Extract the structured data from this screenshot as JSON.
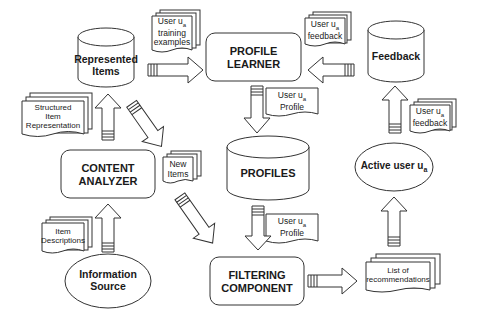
{
  "diagram": {
    "nodes": {
      "represented_items": {
        "label": "Represented Items",
        "shape": "cylinder"
      },
      "profile_learner": {
        "label_line1": "PROFILE",
        "label_line2": "LEARNER",
        "shape": "rounded-rect"
      },
      "feedback": {
        "label": "Feedback",
        "shape": "cylinder"
      },
      "content_analyzer": {
        "label_line1": "CONTENT",
        "label_line2": "ANALYZER",
        "shape": "rounded-rect"
      },
      "profiles": {
        "label": "PROFILES",
        "shape": "cylinder"
      },
      "active_user": {
        "label": "Active user u",
        "subscript": "a",
        "shape": "ellipse"
      },
      "information_source": {
        "label_line1": "Information",
        "label_line2": "Source",
        "shape": "ellipse"
      },
      "filtering_component": {
        "label_line1": "FILTERING",
        "label_line2": "COMPONENT",
        "shape": "rounded-rect"
      }
    },
    "documents": {
      "training_examples": {
        "line1": "User u",
        "line1_sub": "a",
        "line2": "training",
        "line3": "examples"
      },
      "feedback_top": {
        "line1": "User u",
        "line1_sub": "a",
        "line2": "feedback"
      },
      "profile_top": {
        "line1": "User u",
        "line1_sub": "a",
        "line2": "Profile"
      },
      "structured_item": {
        "line1": "Structured",
        "line2": "Item",
        "line3": "Representation"
      },
      "new_items": {
        "line1": "New",
        "line2": "Items"
      },
      "feedback_right": {
        "line1": "User u",
        "line1_sub": "a",
        "line2": "feedback"
      },
      "profile_bottom": {
        "line1": "User u",
        "line1_sub": "a",
        "line2": "Profile"
      },
      "item_descriptions": {
        "line1": "Item",
        "line2": "Descriptions"
      },
      "recommendations": {
        "line1": "List of",
        "line2": "recommendations"
      }
    },
    "edges": [
      {
        "from": "Represented Items",
        "to": "PROFILE LEARNER",
        "carries": "User ua training examples"
      },
      {
        "from": "Feedback",
        "to": "PROFILE LEARNER",
        "carries": "User ua feedback"
      },
      {
        "from": "PROFILE LEARNER",
        "to": "PROFILES",
        "carries": "User ua Profile"
      },
      {
        "from": "CONTENT ANALYZER",
        "to": "Represented Items",
        "carries": "Structured Item Representation"
      },
      {
        "from": "Represented Items",
        "to": "CONTENT ANALYZER side",
        "carries": "New Items"
      },
      {
        "from": "CONTENT ANALYZER",
        "to": "FILTERING COMPONENT",
        "carries": "New Items"
      },
      {
        "from": "PROFILES",
        "to": "FILTERING COMPONENT",
        "carries": "User ua Profile"
      },
      {
        "from": "Information Source",
        "to": "CONTENT ANALYZER",
        "carries": "Item Descriptions"
      },
      {
        "from": "FILTERING COMPONENT",
        "to": "List of recommendations",
        "carries": ""
      },
      {
        "from": "List of recommendations",
        "to": "Active user ua",
        "carries": ""
      },
      {
        "from": "Active user ua",
        "to": "Feedback",
        "carries": "User ua feedback"
      }
    ]
  }
}
